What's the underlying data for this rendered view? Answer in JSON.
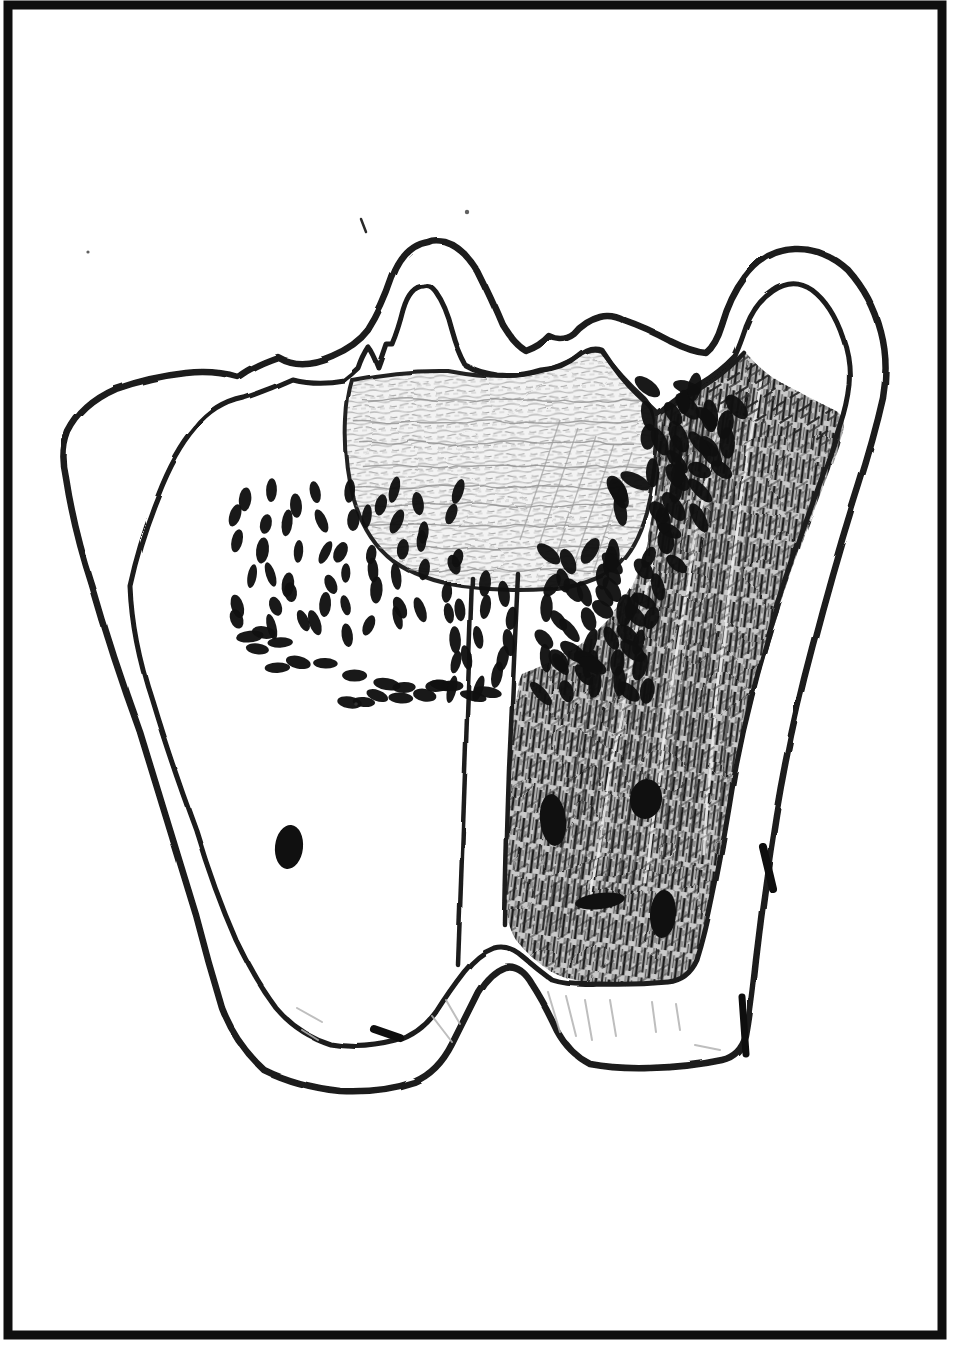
{
  "page": {
    "background": "#ffffff",
    "frame": {
      "color": "#0f0f0f",
      "thickness": 9
    }
  },
  "drawing": {
    "ink": "#1a1a1a",
    "bean_color": "#101010",
    "shading_light": "#8f8f8f",
    "hatch_dark": "#2e2e2e",
    "regions": [
      {
        "name": "outer-wall"
      },
      {
        "name": "inner-wall"
      },
      {
        "name": "crown-bowl-shaded"
      },
      {
        "name": "bean-cell-band"
      },
      {
        "name": "hatched-wedge"
      },
      {
        "name": "root-canal-channel"
      },
      {
        "name": "left-chamber"
      },
      {
        "name": "left-root"
      },
      {
        "name": "right-root"
      },
      {
        "name": "valley-hump"
      }
    ],
    "bean_clusters": [
      {
        "name": "left-block",
        "type": "rect",
        "seed": 11,
        "x": 232,
        "y": 486,
        "w": 232,
        "h": 152,
        "count": 52,
        "angle": 90,
        "jitter": 26,
        "len": [
          9.5,
          13.5
        ],
        "wid": [
          4.5,
          6.5
        ]
      },
      {
        "name": "lower-arc",
        "type": "band",
        "seed": 22,
        "p0": [
          248,
          638
        ],
        "p1": [
          370,
          715
        ],
        "p2": [
          500,
          695
        ],
        "width": 34,
        "count": 20,
        "angle": 8,
        "jitter": 16,
        "len": [
          11,
          14.5
        ],
        "wid": [
          5,
          6.5
        ]
      },
      {
        "name": "mid-under-bowl",
        "type": "rect",
        "seed": 33,
        "x": 430,
        "y": 576,
        "w": 94,
        "h": 120,
        "count": 15,
        "angle": 92,
        "jitter": 16,
        "len": [
          10,
          14
        ],
        "wid": [
          4.5,
          6
        ]
      },
      {
        "name": "right-block",
        "type": "rect",
        "seed": 44,
        "x": 528,
        "y": 548,
        "w": 134,
        "h": 156,
        "count": 30,
        "angle": 78,
        "jitter": 44,
        "len": [
          11,
          15
        ],
        "wid": [
          5.5,
          7.5
        ]
      },
      {
        "name": "right-diagonal-band",
        "type": "band",
        "seed": 55,
        "p0": [
          700,
          400
        ],
        "p1": [
          652,
          540
        ],
        "p2": [
          578,
          676
        ],
        "width": 92,
        "count": 42,
        "angle": 62,
        "jitter": 42,
        "len": [
          12,
          17
        ],
        "wid": [
          6,
          8.5
        ]
      },
      {
        "name": "upper-right-patch",
        "type": "rect",
        "seed": 66,
        "x": 642,
        "y": 384,
        "w": 100,
        "h": 104,
        "count": 16,
        "angle": 60,
        "jitter": 42,
        "len": [
          12,
          16
        ],
        "wid": [
          6,
          8
        ]
      }
    ],
    "hatch_blobs": [
      {
        "cx": 553,
        "cy": 820,
        "rx": 13,
        "ry": 26,
        "rot": -6
      },
      {
        "cx": 646,
        "cy": 799,
        "rx": 16,
        "ry": 20,
        "rot": 8
      },
      {
        "cx": 600,
        "cy": 901,
        "rx": 25,
        "ry": 8,
        "rot": -7
      },
      {
        "cx": 663,
        "cy": 914,
        "rx": 13,
        "ry": 24,
        "rot": 4
      }
    ],
    "left_blob": {
      "cx": 289,
      "cy": 847,
      "rx": 14,
      "ry": 22,
      "rot": 6
    },
    "ticks": [
      {
        "x1": 374,
        "y1": 1029,
        "x2": 400,
        "y2": 1038,
        "w": 8
      },
      {
        "x1": 763,
        "y1": 847,
        "x2": 773,
        "y2": 889,
        "w": 8
      },
      {
        "x1": 742,
        "y1": 997,
        "x2": 746,
        "y2": 1054,
        "w": 7
      }
    ],
    "specks": [
      {
        "type": "stroke",
        "x1": 361,
        "y1": 219,
        "x2": 366,
        "y2": 232
      },
      {
        "type": "dot",
        "x": 467,
        "y": 212,
        "r": 2.2
      },
      {
        "type": "dot",
        "x": 88,
        "y": 252,
        "r": 1.6
      },
      {
        "type": "dot",
        "x": 356,
        "y": 704,
        "r": 1.8
      },
      {
        "type": "dot",
        "x": 540,
        "y": 758,
        "r": 1.5
      }
    ],
    "shading_strokes": [
      {
        "x1": 297,
        "y1": 1008,
        "x2": 322,
        "y2": 1022
      },
      {
        "x1": 302,
        "y1": 1030,
        "x2": 318,
        "y2": 1040
      },
      {
        "x1": 432,
        "y1": 1016,
        "x2": 452,
        "y2": 1042
      },
      {
        "x1": 446,
        "y1": 1000,
        "x2": 460,
        "y2": 1024
      },
      {
        "x1": 548,
        "y1": 992,
        "x2": 560,
        "y2": 1032
      },
      {
        "x1": 566,
        "y1": 996,
        "x2": 576,
        "y2": 1036
      },
      {
        "x1": 585,
        "y1": 1000,
        "x2": 592,
        "y2": 1040
      },
      {
        "x1": 610,
        "y1": 1000,
        "x2": 616,
        "y2": 1036
      },
      {
        "x1": 652,
        "y1": 1002,
        "x2": 656,
        "y2": 1032
      },
      {
        "x1": 676,
        "y1": 1004,
        "x2": 680,
        "y2": 1030
      },
      {
        "x1": 695,
        "y1": 1045,
        "x2": 720,
        "y2": 1050
      }
    ],
    "hatch_fan": {
      "count": 13,
      "top": [
        [
          656,
          438
        ],
        [
          770,
          372
        ]
      ],
      "bottom": [
        [
          545,
          935
        ],
        [
          718,
          848
        ]
      ]
    },
    "bowl_scribbles": {
      "rows": 9,
      "x0": 350,
      "x1": 650,
      "y0": 402,
      "dy": 21
    }
  }
}
